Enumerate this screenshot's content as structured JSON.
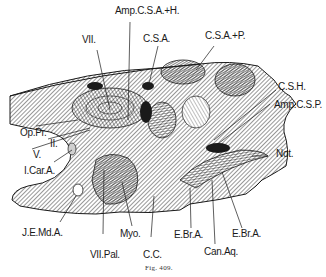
{
  "figure": {
    "caption": "Fig. 409.",
    "colors": {
      "ink": "#1a1a1a",
      "paper": "#ffffff"
    },
    "labels": {
      "amp_csa_h": "Amp.C.S.A.+H.",
      "vii": "VII.",
      "csa": "C.S.A.",
      "csa_p": "C.S.A.+P.",
      "csh": "C.S.H.",
      "amp_csp": "Amp.C.S.P.",
      "op_pr": "Op.Pr.",
      "ii": "II.",
      "v": "V.",
      "i_car_a": "I.Car.A.",
      "not": "Not.",
      "j_e_md_a": "J.E.Md.A.",
      "vii_pal": "VII.Pal.",
      "myo": "Myo.",
      "cc": "C.C.",
      "e_br_a_1": "E.Br.A.",
      "e_br_a_2": "E.Br.A.",
      "can_aq": "Can.Aq."
    }
  }
}
